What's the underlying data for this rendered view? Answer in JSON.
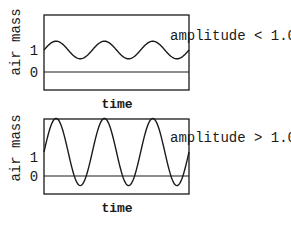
{
  "chart_data": [
    {
      "type": "line",
      "title": "",
      "annotation": "amplitude < 1.0",
      "xlabel": "time",
      "ylabel": "air mass",
      "yticks": [
        "1",
        "0"
      ],
      "series": [
        {
          "name": "air mass",
          "description": "sine oscillation about 1 with amplitude < 1.0 (about 0.4); stays above 0",
          "center": 1.0,
          "amplitude": 0.4,
          "cycles": 3
        }
      ],
      "reference_line": {
        "y": 0
      },
      "grid": false,
      "legend": "none"
    },
    {
      "type": "line",
      "title": "",
      "annotation": "amplitude > 1.0",
      "xlabel": "time",
      "ylabel": "air mass",
      "yticks": [
        "1",
        "0"
      ],
      "series": [
        {
          "name": "air mass",
          "description": "sine oscillation about 1 with amplitude > 1.0 (about 1.4); dips below 0",
          "center": 1.0,
          "amplitude": 1.4,
          "cycles": 3
        }
      ],
      "reference_line": {
        "y": 0
      },
      "grid": false,
      "legend": "none"
    }
  ],
  "panels": {
    "top": {
      "ylabel": "air mass",
      "tick_1": "1",
      "tick_0": "0",
      "xlabel": "time",
      "annotation": "amplitude < 1.0"
    },
    "bottom": {
      "ylabel": "air mass",
      "tick_1": "1",
      "tick_0": "0",
      "xlabel": "time",
      "annotation": "amplitude > 1.0"
    }
  },
  "colors": {
    "ink": "#1a1a1a",
    "background": "#ffffff"
  }
}
